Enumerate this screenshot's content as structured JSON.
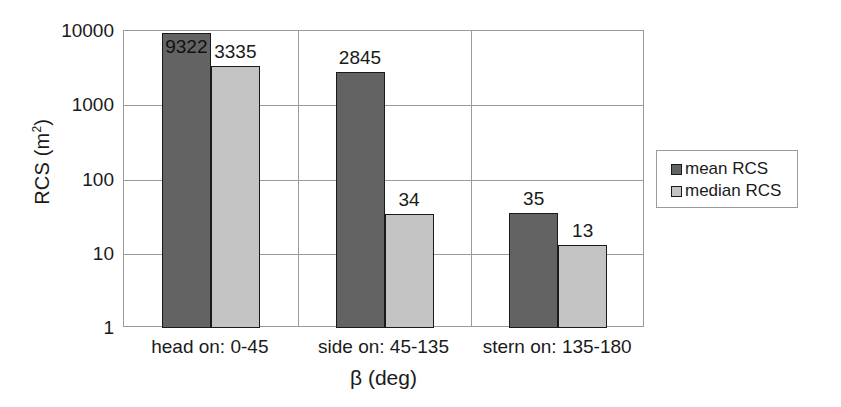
{
  "chart_data": {
    "type": "bar",
    "title": "",
    "xlabel": "β (deg)",
    "ylabel": "RCS (m²)",
    "ylabel_base": "RCS (m",
    "ylabel_sup": "2",
    "ylabel_close": ")",
    "yscale": "log",
    "ylim": [
      1,
      10000
    ],
    "ytick_labels": [
      "10000",
      "1000",
      "100",
      "10",
      "1"
    ],
    "ytick_values": [
      10000,
      1000,
      100,
      10,
      1
    ],
    "grid": true,
    "legend_position": "right",
    "categories": [
      "head on:  0-45",
      "side on: 45-135",
      "stern on: 135-180"
    ],
    "series": [
      {
        "name": "mean RCS",
        "color": "#636363",
        "values": [
          9322,
          2845,
          35
        ]
      },
      {
        "name": "median RCS",
        "color": "#c3c3c3",
        "values": [
          3335,
          34,
          13
        ]
      }
    ],
    "data_labels": [
      [
        "9322",
        "3335"
      ],
      [
        "2845",
        "34"
      ],
      [
        "35",
        "13"
      ]
    ]
  },
  "legend": {
    "entries": [
      {
        "label": "mean RCS"
      },
      {
        "label": "median RCS"
      }
    ]
  },
  "axes": {
    "y_title": "RCS (m",
    "y_title_sup": "2",
    "y_title_end": ")",
    "x_title": "β (deg)"
  }
}
